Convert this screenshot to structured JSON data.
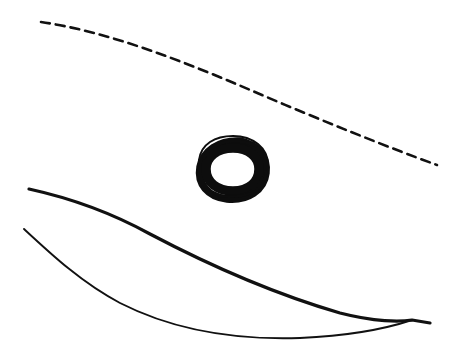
{
  "canvas": {
    "width": 455,
    "height": 357,
    "background_color": "#ffffff",
    "ink_color": "#111111",
    "medium": "hand-drawn ink line sketch",
    "title": "Hand-drawn line sketch"
  },
  "elements": [
    {
      "id": "dashed-arc",
      "name": "dashed-curve",
      "label": "Dashed curved line",
      "style": "dashed",
      "stroke_width": 2.6,
      "dash_pattern": "9 6",
      "color": "#111111",
      "start_point": [
        41,
        22
      ],
      "end_point": [
        437,
        165
      ],
      "path": "M41,22 C110,32 185,62 255,92 C320,120 390,148 437,165"
    },
    {
      "id": "spiral-ring",
      "name": "spiral-ring",
      "label": "Spiral ring",
      "style": "solid",
      "color": "#0d0d0d",
      "center": [
        232,
        169
      ],
      "radius_x": 36,
      "radius_y": 31,
      "bounds": [
        196,
        138,
        268,
        200
      ],
      "inner_radius_x": 21,
      "inner_radius_y": 18,
      "thick_stroke_width": 9,
      "thin_stroke_width": 2.2
    },
    {
      "id": "upper-sweep",
      "name": "upper-sweep-curve",
      "label": "Upper long sweeping line",
      "style": "solid",
      "stroke_width": 3.2,
      "color": "#111111",
      "start_point": [
        29,
        189
      ],
      "end_point": [
        430,
        323
      ],
      "path": "M29,189 C70,198 110,212 150,234 C205,263 275,294 340,313 C375,322 400,322 412,320 L430,323"
    },
    {
      "id": "lower-sweep",
      "name": "lower-sweep-curve",
      "label": "Lower curved line forming lens shape",
      "style": "solid",
      "stroke_width": 1.9,
      "color": "#111111",
      "start_point": [
        24,
        229
      ],
      "end_point": [
        412,
        320
      ],
      "path": "M24,229 C52,255 82,283 120,303 C175,331 240,340 300,338 C345,336 385,329 412,320"
    }
  ],
  "composition": {
    "stroke_count": 4,
    "description": "A dashed arc across the top, a thick spiral ring in the center, and two converging curves forming a lens shape at the bottom"
  }
}
